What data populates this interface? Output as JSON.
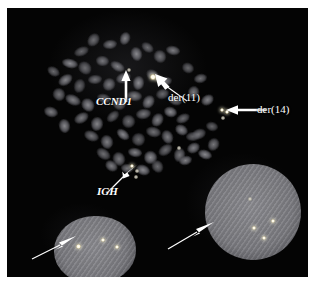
{
  "figure": {
    "kind": "fish-micrograph",
    "modality": "Fluorescence in situ hybridization (FISH)",
    "background_color": "#050505",
    "page_color": "#ffffff",
    "signal_color": "#fffbe6",
    "chromosome_color": "#8c8c92",
    "nucleus_color": "#7d7d82",
    "arrow_color": "#ffffff"
  },
  "annotations": [
    {
      "id": "ccnd1",
      "label": "CCND1",
      "style": "italic",
      "x": 96,
      "y": 96,
      "arrow": "up"
    },
    {
      "id": "der11",
      "label": "der(11)",
      "style": "roman",
      "x": 168,
      "y": 92,
      "arrow": "up-left"
    },
    {
      "id": "der14",
      "label": "der(14)",
      "style": "roman",
      "x": 257,
      "y": 105,
      "arrow": "left"
    },
    {
      "id": "igh",
      "label": "IGH",
      "style": "italic",
      "x": 97,
      "y": 186,
      "arrow": "up-right"
    }
  ],
  "unlabeled_arrows": [
    {
      "id": "arrow-nucleus-left",
      "points_to": "lower-left interphase nucleus",
      "direction": "up-right"
    },
    {
      "id": "arrow-nucleus-right",
      "points_to": "lower-right interphase nucleus",
      "direction": "up-right"
    }
  ],
  "nuclei": [
    {
      "id": "nucleus-left",
      "signal_count": 3
    },
    {
      "id": "nucleus-right",
      "signal_count": 4
    }
  ],
  "chart_data": {
    "type": "scatter",
    "title": "",
    "chromosomes": [
      [
        74,
        43,
        15,
        9,
        -22
      ],
      [
        86,
        32,
        11,
        14,
        38
      ],
      [
        103,
        36,
        14,
        9,
        -8
      ],
      [
        118,
        30,
        10,
        13,
        22
      ],
      [
        63,
        55,
        16,
        9,
        12
      ],
      [
        78,
        60,
        12,
        14,
        -40
      ],
      [
        95,
        53,
        13,
        10,
        6
      ],
      [
        110,
        58,
        15,
        9,
        28
      ],
      [
        129,
        46,
        11,
        14,
        -16
      ],
      [
        140,
        39,
        13,
        9,
        34
      ],
      [
        153,
        48,
        12,
        13,
        -28
      ],
      [
        166,
        42,
        14,
        9,
        10
      ],
      [
        58,
        72,
        15,
        10,
        -34
      ],
      [
        72,
        78,
        11,
        14,
        18
      ],
      [
        88,
        71,
        14,
        9,
        -6
      ],
      [
        102,
        76,
        12,
        13,
        42
      ],
      [
        116,
        70,
        15,
        10,
        -20
      ],
      [
        131,
        75,
        11,
        14,
        8
      ],
      [
        145,
        67,
        13,
        10,
        30
      ],
      [
        158,
        73,
        14,
        9,
        -12
      ],
      [
        66,
        92,
        16,
        10,
        24
      ],
      [
        81,
        97,
        12,
        14,
        -36
      ],
      [
        97,
        90,
        14,
        9,
        14
      ],
      [
        112,
        95,
        13,
        13,
        -24
      ],
      [
        127,
        88,
        15,
        10,
        6
      ],
      [
        141,
        94,
        11,
        14,
        36
      ],
      [
        155,
        86,
        13,
        10,
        -18
      ],
      [
        168,
        92,
        14,
        9,
        20
      ],
      [
        74,
        110,
        15,
        10,
        -30
      ],
      [
        90,
        116,
        12,
        14,
        10
      ],
      [
        106,
        108,
        14,
        9,
        -42
      ],
      [
        121,
        113,
        13,
        13,
        26
      ],
      [
        136,
        106,
        15,
        10,
        -10
      ],
      [
        150,
        112,
        11,
        14,
        32
      ],
      [
        163,
        104,
        13,
        10,
        16
      ],
      [
        176,
        110,
        14,
        9,
        -26
      ],
      [
        84,
        128,
        15,
        10,
        22
      ],
      [
        100,
        134,
        12,
        14,
        -14
      ],
      [
        116,
        126,
        14,
        9,
        38
      ],
      [
        131,
        131,
        13,
        13,
        -32
      ],
      [
        146,
        124,
        15,
        10,
        12
      ],
      [
        160,
        129,
        11,
        14,
        -22
      ],
      [
        174,
        122,
        13,
        10,
        28
      ],
      [
        186,
        128,
        14,
        9,
        -6
      ],
      [
        96,
        146,
        15,
        10,
        34
      ],
      [
        112,
        151,
        12,
        14,
        -18
      ],
      [
        128,
        144,
        14,
        9,
        8
      ],
      [
        143,
        149,
        13,
        13,
        24
      ],
      [
        158,
        142,
        15,
        10,
        -36
      ],
      [
        172,
        147,
        11,
        14,
        14
      ],
      [
        186,
        140,
        13,
        10,
        -28
      ],
      [
        198,
        146,
        14,
        9,
        18
      ],
      [
        46,
        63,
        13,
        9,
        30
      ],
      [
        52,
        86,
        12,
        13,
        -24
      ],
      [
        44,
        104,
        14,
        10,
        16
      ],
      [
        57,
        118,
        11,
        14,
        -8
      ],
      [
        181,
        60,
        12,
        10,
        26
      ],
      [
        193,
        70,
        13,
        9,
        -14
      ],
      [
        186,
        84,
        11,
        13,
        20
      ],
      [
        200,
        92,
        13,
        10,
        -34
      ],
      [
        205,
        118,
        12,
        9,
        12
      ],
      [
        192,
        126,
        14,
        10,
        -20
      ],
      [
        206,
        136,
        11,
        13,
        28
      ],
      [
        178,
        152,
        13,
        9,
        -16
      ],
      [
        136,
        162,
        14,
        10,
        20
      ],
      [
        150,
        158,
        11,
        13,
        -30
      ],
      [
        120,
        160,
        12,
        9,
        10
      ],
      [
        104,
        158,
        13,
        10,
        34
      ]
    ],
    "signals": [
      {
        "x": 146,
        "y": 69,
        "r": 2.6,
        "bright": true,
        "note": "der(11) fusion"
      },
      {
        "x": 151,
        "y": 71,
        "r": 2.2,
        "bright": true,
        "note": "der(11) fusion"
      },
      {
        "x": 215,
        "y": 102,
        "r": 2.4,
        "bright": true,
        "note": "der(14) fusion"
      },
      {
        "x": 220,
        "y": 104,
        "r": 2.0,
        "bright": true,
        "note": "der(14) fusion"
      },
      {
        "x": 216,
        "y": 110,
        "r": 1.8,
        "bright": false,
        "note": "der(14) fusion"
      },
      {
        "x": 122,
        "y": 62,
        "r": 1.9,
        "bright": false,
        "note": "CCND1 native"
      },
      {
        "x": 125,
        "y": 158,
        "r": 2.1,
        "bright": true,
        "note": "IGH native"
      },
      {
        "x": 130,
        "y": 163,
        "r": 1.8,
        "bright": false,
        "note": "IGH native"
      },
      {
        "x": 129,
        "y": 169,
        "r": 1.7,
        "bright": false,
        "note": "IGH native"
      },
      {
        "x": 172,
        "y": 140,
        "r": 1.6,
        "bright": false,
        "note": "spread signal"
      },
      {
        "x": 71,
        "y": 238,
        "r": 2.5,
        "bright": true,
        "note": "nucleus-left signal"
      },
      {
        "x": 96,
        "y": 232,
        "r": 2.4,
        "bright": true,
        "note": "nucleus-left signal"
      },
      {
        "x": 110,
        "y": 239,
        "r": 2.3,
        "bright": true,
        "note": "nucleus-left signal"
      },
      {
        "x": 243,
        "y": 191,
        "r": 1.8,
        "bright": false,
        "note": "nucleus-right signal"
      },
      {
        "x": 266,
        "y": 213,
        "r": 2.3,
        "bright": true,
        "note": "nucleus-right signal"
      },
      {
        "x": 247,
        "y": 220,
        "r": 2.2,
        "bright": true,
        "note": "nucleus-right signal"
      },
      {
        "x": 257,
        "y": 230,
        "r": 2.4,
        "bright": true,
        "note": "nucleus-right signal"
      }
    ],
    "xlabel": "",
    "ylabel": "",
    "grid": false,
    "legend": "none"
  }
}
